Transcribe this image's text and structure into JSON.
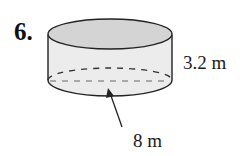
{
  "problem": {
    "number": "6."
  },
  "figure": {
    "shape": "cylinder",
    "dimensions": {
      "height_label": "3.2 m",
      "diameter_label": "8 m"
    },
    "colors": {
      "top_face": "#d4d4d4",
      "body": "#ececec",
      "outline": "#222222",
      "hidden_edge": "#444444"
    }
  }
}
